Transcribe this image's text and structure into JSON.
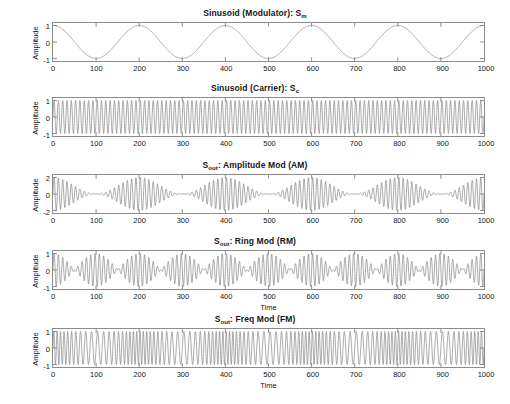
{
  "figure": {
    "background": "#ffffff",
    "axis_color": "#8c8c8c",
    "line_color": "#7d7d7d"
  },
  "panels": [
    {
      "id": "modulator",
      "title_main": "Sinusoid (Modulator): S",
      "title_sub": "m",
      "ylabel": "Amplitude",
      "xlabel": "",
      "yticks": [
        "1",
        "0",
        "-1"
      ],
      "ytick_values": [
        1,
        0,
        -1
      ],
      "xticks": [
        "0",
        "100",
        "200",
        "300",
        "400",
        "500",
        "600",
        "700",
        "800",
        "900",
        "1000"
      ]
    },
    {
      "id": "carrier",
      "title_main": "Sinusoid (Carrier): S",
      "title_sub": "c",
      "ylabel": "Amplitude",
      "xlabel": "",
      "yticks": [
        "1",
        "0",
        "-1"
      ],
      "ytick_values": [
        1,
        0,
        -1
      ],
      "xticks": [
        "0",
        "100",
        "200",
        "300",
        "400",
        "500",
        "600",
        "700",
        "800",
        "900",
        "1000"
      ]
    },
    {
      "id": "am",
      "title_main": "S",
      "title_sub": "out",
      "title_tail": ": Amplitude Mod (AM)",
      "ylabel": "Amplitude",
      "xlabel": "",
      "yticks": [
        "2",
        "0",
        "-2"
      ],
      "ytick_values": [
        2,
        0,
        -2
      ],
      "xticks": [
        "0",
        "100",
        "200",
        "300",
        "400",
        "500",
        "600",
        "700",
        "800",
        "900",
        "1000"
      ]
    },
    {
      "id": "rm",
      "title_main": "S",
      "title_sub": "out",
      "title_tail": ": Ring Mod (RM)",
      "ylabel": "Amplitude",
      "xlabel": "Time",
      "yticks": [
        "1",
        "0",
        "-1"
      ],
      "ytick_values": [
        1,
        0,
        -1
      ],
      "xticks": [
        "0",
        "100",
        "200",
        "300",
        "400",
        "500",
        "600",
        "700",
        "800",
        "900",
        "1000"
      ]
    },
    {
      "id": "fm",
      "title_main": "S",
      "title_sub": "out",
      "title_tail": ": Freq Mod (FM)",
      "ylabel": "Amplitude",
      "xlabel": "Time",
      "yticks": [
        "1",
        "0",
        "-1"
      ],
      "ytick_values": [
        1,
        0,
        -1
      ],
      "xticks": [
        "0",
        "100",
        "200",
        "300",
        "400",
        "500",
        "600",
        "700",
        "800",
        "900",
        "1000"
      ]
    }
  ],
  "chart_data": [
    {
      "type": "line",
      "id": "modulator",
      "title": "Sinusoid (Modulator): S_m",
      "xlabel": "",
      "ylabel": "Amplitude",
      "xlim": [
        0,
        1000
      ],
      "ylim": [
        -1.15,
        1.15
      ],
      "xticks": [
        0,
        100,
        200,
        300,
        400,
        500,
        600,
        700,
        800,
        900,
        1000
      ],
      "yticks": [
        -1,
        0,
        1
      ],
      "grid": false,
      "legend": "none",
      "formula": "cos(2*pi*t/200)",
      "period": 200,
      "cycles": 5,
      "amplitude": 1,
      "series": [
        {
          "name": "S_m",
          "description": "Low-frequency cosine modulator, peaks at t=0,200,400,600,800,1000 and troughs at t=100,300,500,700,900"
        }
      ]
    },
    {
      "type": "line",
      "id": "carrier",
      "title": "Sinusoid (Carrier): S_c",
      "xlabel": "",
      "ylabel": "Amplitude",
      "xlim": [
        0,
        1000
      ],
      "ylim": [
        -1.15,
        1.15
      ],
      "xticks": [
        0,
        100,
        200,
        300,
        400,
        500,
        600,
        700,
        800,
        900,
        1000
      ],
      "yticks": [
        -1,
        0,
        1
      ],
      "grid": false,
      "legend": "none",
      "formula": "sin(2*pi*t/10)",
      "period": 10,
      "cycles": 100,
      "amplitude": 1,
      "series": [
        {
          "name": "S_c",
          "description": "High-frequency carrier sinusoid filling the axes uniformly between -1 and 1"
        }
      ]
    },
    {
      "type": "line",
      "id": "am",
      "title": "S_out: Amplitude Mod (AM)",
      "xlabel": "",
      "ylabel": "Amplitude",
      "xlim": [
        0,
        1000
      ],
      "ylim": [
        -2.3,
        2.3
      ],
      "xticks": [
        0,
        100,
        200,
        300,
        400,
        500,
        600,
        700,
        800,
        900,
        1000
      ],
      "yticks": [
        -2,
        0,
        2
      ],
      "grid": false,
      "legend": "none",
      "formula": "(1 + cos(2*pi*t/200)) * sin(2*pi*t/10)",
      "envelope_period": 200,
      "amplitude_max": 2,
      "amplitude_min": 0,
      "series": [
        {
          "name": "S_out AM",
          "description": "Carrier amplitude swells to 2 at t=0,200,400,600,800,1000 and collapses to 0 at t=100,300,500,700,900"
        }
      ]
    },
    {
      "type": "line",
      "id": "rm",
      "title": "S_out: Ring Mod (RM)",
      "xlabel": "Time",
      "ylabel": "Amplitude",
      "xlim": [
        0,
        1000
      ],
      "ylim": [
        -1.15,
        1.15
      ],
      "xticks": [
        0,
        100,
        200,
        300,
        400,
        500,
        600,
        700,
        800,
        900,
        1000
      ],
      "yticks": [
        -1,
        0,
        1
      ],
      "grid": false,
      "legend": "none",
      "formula": "cos(2*pi*t/200) * sin(2*pi*t/10)",
      "envelope_period": 200,
      "amplitude_max": 1,
      "series": [
        {
          "name": "S_out RM",
          "description": "Carrier multiplied by bipolar modulator; envelope nodes (zero crossings of envelope) at t=50,150,250,350,450,550,650,750,850,950"
        }
      ]
    },
    {
      "type": "line",
      "id": "fm",
      "title": "S_out: Freq Mod (FM)",
      "xlabel": "Time",
      "ylabel": "Amplitude",
      "xlim": [
        0,
        1000
      ],
      "ylim": [
        -1.15,
        1.15
      ],
      "xticks": [
        0,
        100,
        200,
        300,
        400,
        500,
        600,
        700,
        800,
        900,
        1000
      ],
      "yticks": [
        -1,
        0,
        1
      ],
      "grid": false,
      "legend": "none",
      "formula": "sin(2*pi*t/10 + 6*sin(2*pi*t/200))",
      "amplitude": 1,
      "modulation_index": 6,
      "series": [
        {
          "name": "S_out FM",
          "description": "Constant amplitude 1 with instantaneous frequency varying over the modulator period of 200"
        }
      ]
    }
  ]
}
